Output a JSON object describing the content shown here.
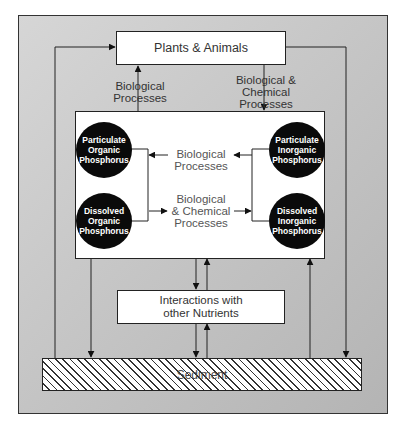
{
  "nodes": {
    "plants_animals": "Plants & Animals",
    "interactions": "Interactions with other Nutrients",
    "sediment": "Sediment",
    "particulate_organic": "Particulate Organic Phosphorus",
    "dissolved_organic": "Dissolved Organic Phosphorus",
    "particulate_inorganic": "Particulate Inorganic Phosphorus",
    "dissolved_inorganic": "Dissolved Inorganic Phosphorus"
  },
  "labels": {
    "bio_up_1": "Biological",
    "bio_up_2": "Processes",
    "biochem_down_1": "Biological &",
    "biochem_down_2": "Chemical Processes",
    "inner_bio_1": "Biological",
    "inner_bio_2": "Processes",
    "inner_biochem_1": "Biological",
    "inner_biochem_2": "& Chemical",
    "inner_biochem_3": "Processes"
  },
  "colors": {
    "background_frame": "#c8c8c8",
    "node_fill": "#ffffff",
    "circle_fill": "#0a0a0a",
    "line": "#222222"
  }
}
